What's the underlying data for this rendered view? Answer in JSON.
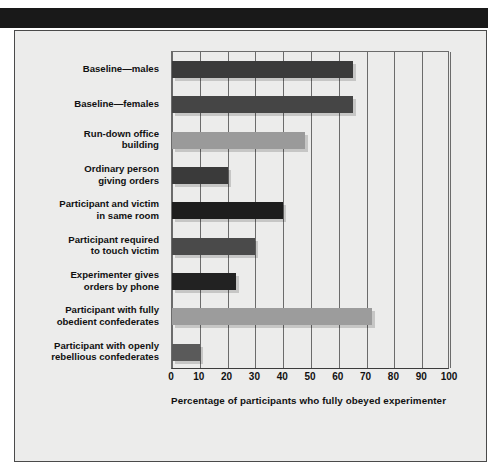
{
  "figure": {
    "banner_color": "#191919",
    "panel_bg": "#ececeb",
    "border_color": "#4a4a4a"
  },
  "chart_data": {
    "type": "bar",
    "orientation": "horizontal",
    "title": "",
    "xlabel": "Percentage of participants who fully obeyed experimenter",
    "ylabel": "",
    "xlim": [
      0,
      100
    ],
    "xticks": [
      "0",
      "10",
      "20",
      "30",
      "40",
      "50",
      "60",
      "70",
      "80",
      "90",
      "100"
    ],
    "grid": "vertical",
    "legend": "none",
    "categories": [
      "Baseline—males",
      "Baseline—females",
      "Run-down office building",
      "Ordinary person giving orders",
      "Participant and victim in same room",
      "Participant required to touch victim",
      "Experimenter gives orders by phone",
      "Participant with fully obedient confederates",
      "Participant with openly rebellious confederates"
    ],
    "category_lines": [
      [
        "Baseline—males"
      ],
      [
        "Baseline—females"
      ],
      [
        "Run-down office",
        "building"
      ],
      [
        "Ordinary person",
        "giving orders"
      ],
      [
        "Participant and victim",
        "in same room"
      ],
      [
        "Participant required",
        "to touch victim"
      ],
      [
        "Experimenter gives",
        "orders by phone"
      ],
      [
        "Participant with fully",
        "obedient confederates"
      ],
      [
        "Participant with openly",
        "rebellious confederates"
      ]
    ],
    "values": [
      65,
      65,
      48,
      20,
      40,
      30,
      23,
      72,
      10
    ],
    "bar_colors": [
      "#3b3b3b",
      "#454545",
      "#9a9a9a",
      "#3a3a3a",
      "#1d1d1d",
      "#4a4a4a",
      "#222222",
      "#9c9c9c",
      "#5a5a5a"
    ]
  }
}
